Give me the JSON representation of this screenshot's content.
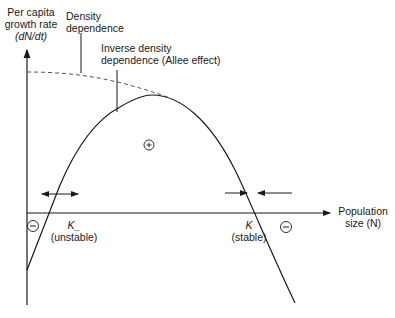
{
  "diagram": {
    "y_axis_label": [
      "Per capita",
      "growth rate",
      "(dN/dt)"
    ],
    "x_axis_label": [
      "Population",
      "size (N)"
    ],
    "annotations": {
      "density_dependence": [
        "Density",
        "dependence"
      ],
      "inverse_density_dependence": [
        "Inverse density",
        "dependence (Allee effect)"
      ],
      "k_minus": "K_",
      "k_minus_note": "(unstable)",
      "k": "K",
      "k_note": "(stable)"
    },
    "signs": {
      "positive": "+",
      "negative_left": "−",
      "negative_right": "−"
    },
    "colors": {
      "line": "#1a1a1a",
      "dashed": "#555555"
    }
  }
}
